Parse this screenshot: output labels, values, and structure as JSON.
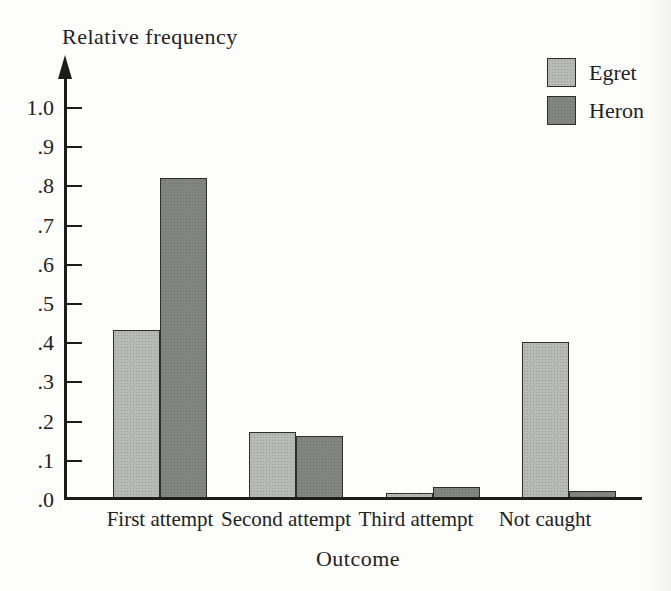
{
  "chart_data": {
    "type": "bar",
    "title": "Relative frequency",
    "ylabel": "Relative frequency",
    "xlabel": "Outcome",
    "categories": [
      "First attempt",
      "Second attempt",
      "Third attempt",
      "Not caught"
    ],
    "series": [
      {
        "name": "Egret",
        "color": "#b7bab6",
        "values": [
          0.43,
          0.17,
          0.015,
          0.4
        ]
      },
      {
        "name": "Heron",
        "color": "#818682",
        "values": [
          0.82,
          0.16,
          0.03,
          0.02
        ]
      }
    ],
    "y_ticks": [
      {
        "label": "1.0",
        "value": 1.0
      },
      {
        "label": ".9",
        "value": 0.9
      },
      {
        "label": ".8",
        "value": 0.8
      },
      {
        "label": ".7",
        "value": 0.7
      },
      {
        "label": ".6",
        "value": 0.6
      },
      {
        "label": ".5",
        "value": 0.5
      },
      {
        "label": ".4",
        "value": 0.4
      },
      {
        "label": ".3",
        "value": 0.3
      },
      {
        "label": ".2",
        "value": 0.2
      },
      {
        "label": ".1",
        "value": 0.1
      },
      {
        "label": ".0",
        "value": 0.0
      }
    ],
    "ylim": [
      0,
      1.0
    ],
    "grid": false,
    "legend_position": "top-right",
    "axis_color": "#1c1c1c",
    "text_color": "#222222"
  }
}
